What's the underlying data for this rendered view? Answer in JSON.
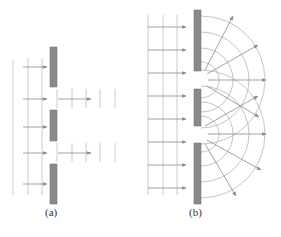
{
  "panels": [
    {
      "id": "a",
      "label": "(a)",
      "description": "Plane waves incident on barrier with two narrow gaps; transmitted waves continue as straight beams",
      "label_pos": [
        45,
        214
      ]
    },
    {
      "id": "b",
      "label": "(b)",
      "description": "Plane waves incident on barrier with two narrow slits; waves diffract into circular wavefronts that spread and overlap",
      "label_pos": [
        190,
        214
      ]
    }
  ],
  "colors": {
    "barrier": "#8a8a8a",
    "barrier_edge": "#6e6e6e",
    "wavefront": "#bdbdbd",
    "arrow": "#8c8c8c",
    "label": "#333333"
  }
}
